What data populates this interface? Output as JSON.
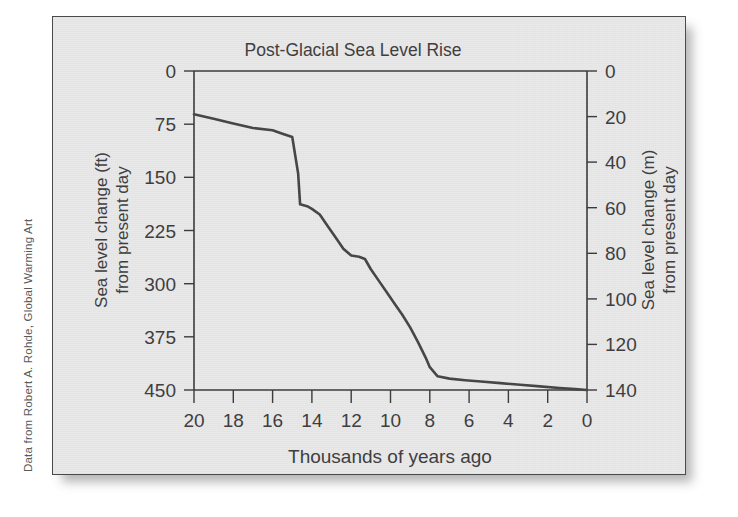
{
  "attribution": "Data from Robert A. Rohde, Global Warming Art",
  "chart_data": {
    "type": "line",
    "title": "Post-Glacial Sea Level Rise",
    "xlabel": "Thousands of years ago",
    "ylabel": "Sea level change (ft)\nfrom present day",
    "ylabel_line1": "Sea level change (ft)",
    "ylabel_line2": "from present day",
    "y2label_line1": "Sea level change (m)",
    "y2label_line2": "from present day",
    "xticks": [
      20,
      18,
      16,
      14,
      12,
      10,
      8,
      6,
      4,
      2,
      0
    ],
    "xtick_labels": [
      "20",
      "18",
      "16",
      "14",
      "12",
      "10",
      "8",
      "6",
      "4",
      "2",
      "0"
    ],
    "yticks_ft": [
      0,
      75,
      150,
      225,
      300,
      375,
      450
    ],
    "ytick_labels_ft": [
      "0",
      "75",
      "150",
      "225",
      "300",
      "375",
      "450"
    ],
    "yticks_m": [
      0,
      20,
      40,
      60,
      80,
      100,
      120,
      140
    ],
    "ytick_labels_m": [
      "0",
      "20",
      "40",
      "60",
      "80",
      "100",
      "120",
      "140"
    ],
    "xlim": [
      20,
      0
    ],
    "ylim_ft": [
      450,
      0
    ],
    "ylim_m": [
      140,
      0
    ],
    "x_axis_inverted": true,
    "y_axis_inverted": true,
    "grid": false,
    "legend": "none",
    "line_color": "#454545",
    "series": [
      {
        "name": "Sea level change from present day",
        "x": [
          20.0,
          19.0,
          18.0,
          17.0,
          16.0,
          15.5,
          15.0,
          14.7,
          14.6,
          14.2,
          14.0,
          13.6,
          13.2,
          12.8,
          12.4,
          12.0,
          11.6,
          11.3,
          11.0,
          10.6,
          10.2,
          9.8,
          9.4,
          9.0,
          8.6,
          8.2,
          8.0,
          7.6,
          7.0,
          6.2,
          5.4,
          4.4,
          3.4,
          2.4,
          1.4,
          0.6,
          0.0
        ],
        "y_m": [
          121.0,
          119.0,
          117.0,
          115.0,
          114.0,
          112.5,
          111.0,
          95.0,
          81.5,
          80.5,
          79.5,
          77.0,
          72.0,
          67.0,
          62.0,
          59.0,
          58.5,
          57.5,
          53.0,
          48.0,
          43.0,
          38.0,
          33.0,
          27.5,
          21.0,
          14.0,
          10.0,
          6.0,
          5.0,
          4.3,
          3.7,
          3.0,
          2.3,
          1.6,
          0.9,
          0.4,
          0.0
        ],
        "y_ft": [
          397,
          390,
          384,
          377,
          374,
          369,
          364,
          312,
          267,
          264,
          261,
          253,
          236,
          220,
          203,
          194,
          192,
          189,
          174,
          157,
          141,
          125,
          108,
          90,
          69,
          46,
          33,
          20,
          16,
          14,
          12,
          10,
          8,
          5,
          3,
          1,
          0
        ]
      }
    ],
    "annotations": []
  }
}
